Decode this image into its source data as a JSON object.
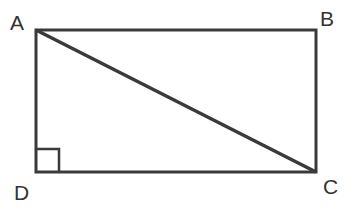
{
  "figure": {
    "type": "rectangle-with-diagonal",
    "stroke_color": "#3a3a3a",
    "vertices": [
      {
        "label": "A",
        "x": 36,
        "y": 30
      },
      {
        "label": "B",
        "x": 316,
        "y": 30
      },
      {
        "label": "C",
        "x": 316,
        "y": 172
      },
      {
        "label": "D",
        "x": 36,
        "y": 172
      }
    ],
    "diagonal": {
      "from": "A",
      "to": "C"
    },
    "right_angle_marker": {
      "at": "D",
      "size": 23
    }
  },
  "labels": {
    "a": "A",
    "b": "B",
    "c": "C",
    "d": "D"
  }
}
